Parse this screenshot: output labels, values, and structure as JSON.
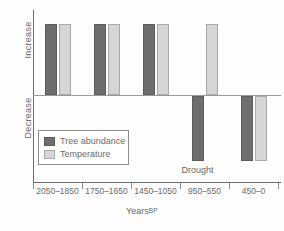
{
  "chart_data": {
    "type": "bar",
    "title": "",
    "subtitle": "",
    "xlabel": "Years BP",
    "xlabel_main": "Years",
    "xlabel_suffix": "BP",
    "ylabel": "",
    "y_axis_labels": {
      "positive": "Increase",
      "negative": "Decrease"
    },
    "ylim": [
      -1,
      1
    ],
    "grid": false,
    "legend_position": "inside-lower-left",
    "categories": [
      "2050–1850",
      "1750–1650",
      "1450–1050",
      "950–550",
      "450–0"
    ],
    "series": [
      {
        "name": "Tree abundance",
        "color": "#6e6e6e",
        "values": [
          1,
          1,
          1,
          -1,
          -1
        ]
      },
      {
        "name": "Temperature",
        "color": "#d6d6d6",
        "values": [
          1,
          1,
          1,
          1,
          -1
        ]
      }
    ],
    "annotations": [
      {
        "text": "Drought",
        "category": "950–550",
        "position": "below-negative-bar"
      }
    ],
    "axis_color": "#6d6d6d",
    "zeroline_color": "#9a9a9a"
  },
  "legend": {
    "items": [
      {
        "label": "Tree abundance",
        "swatch": "dark"
      },
      {
        "label": "Temperature",
        "swatch": "light"
      }
    ]
  }
}
